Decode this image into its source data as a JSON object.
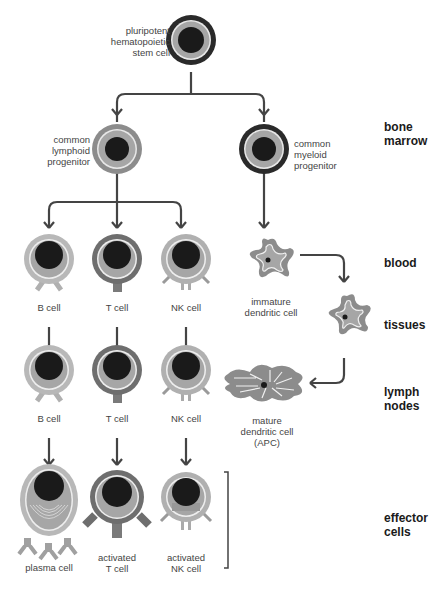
{
  "stages": {
    "bone_marrow": "bone\nmarrow",
    "blood": "blood",
    "tissues": "tissues",
    "lymph_nodes": "lymph\nnodes",
    "effector_cells": "effector\ncells"
  },
  "cells": {
    "stem": "pluripotent\nhematopoietic\nstem cell",
    "lymphoid": "common\nlymphoid\nprogenitor",
    "myeloid": "common\nmyeloid\nprogenitor",
    "b_blood": "B cell",
    "t_blood": "T cell",
    "nk_blood": "NK cell",
    "immature_dc": "immature\ndendritic cell",
    "b_lymph": "B cell",
    "t_lymph": "T cell",
    "nk_lymph": "NK cell",
    "mature_dc": "mature\ndendritic cell\n(APC)",
    "plasma": "plasma cell",
    "activated_t": "activated\nT cell",
    "activated_nk": "activated\nNK cell"
  },
  "colors": {
    "nucleus": "#1a1a1a",
    "cytoplasm": "#a6a6a6",
    "b_membrane": "#b8b8b8",
    "t_membrane": "#6e6e6e",
    "stem_membrane": "#2a2a2a",
    "arrow": "#444444"
  }
}
